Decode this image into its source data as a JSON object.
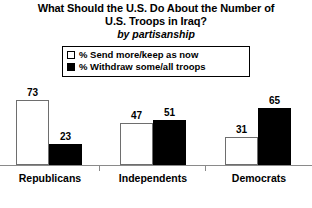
{
  "title": {
    "line1": "What Should the U.S. Do About the Number of",
    "line2": "U.S. Troops in Iraq?",
    "subtitle": "by partisanship"
  },
  "legend": {
    "items": [
      {
        "label": "% Send more/keep as now",
        "style": "open",
        "color": "#ffffff"
      },
      {
        "label": "% Withdraw some/all troops",
        "style": "solid",
        "color": "#000000"
      }
    ]
  },
  "axis": {
    "baseline_color": "#8a8a8a",
    "tick_count": 2
  },
  "chart_data": {
    "type": "bar",
    "title": "What Should the U.S. Do About the Number of U.S. Troops in Iraq?",
    "subtitle": "by partisanship",
    "xlabel": "",
    "ylabel": "",
    "ylim": [
      0,
      80
    ],
    "grid": false,
    "legend_position": "top-center",
    "categories": [
      "Republicans",
      "Independents",
      "Democrats"
    ],
    "series": [
      {
        "name": "% Send more/keep as now",
        "color": "#ffffff",
        "values": [
          73,
          47,
          31
        ]
      },
      {
        "name": "% Withdraw some/all troops",
        "color": "#000000",
        "values": [
          23,
          51,
          65
        ]
      }
    ],
    "value_labels": [
      "73",
      "23",
      "47",
      "51",
      "31",
      "65"
    ]
  },
  "bars": [
    {
      "id": "rep-send",
      "value": "73",
      "style": "open",
      "left": 16,
      "width": 33,
      "height": 65,
      "label_left": 12,
      "label_top": 87
    },
    {
      "id": "rep-withdraw",
      "value": "23",
      "style": "solid",
      "left": 49,
      "width": 33,
      "height": 21,
      "label_left": 45,
      "label_top": 131
    },
    {
      "id": "ind-send",
      "value": "47",
      "style": "open",
      "left": 120,
      "width": 33,
      "height": 42,
      "label_left": 116,
      "label_top": 110
    },
    {
      "id": "ind-withdraw",
      "value": "51",
      "style": "solid",
      "left": 153,
      "width": 33,
      "height": 45,
      "label_left": 149,
      "label_top": 107
    },
    {
      "id": "dem-send",
      "value": "31",
      "style": "open",
      "left": 225,
      "width": 33,
      "height": 28,
      "label_left": 221,
      "label_top": 124
    },
    {
      "id": "dem-withdraw",
      "value": "65",
      "style": "solid",
      "left": 258,
      "width": 33,
      "height": 57,
      "label_left": 254,
      "label_top": 95
    }
  ],
  "group_labels": [
    {
      "text": "Republicans",
      "left": 4,
      "width": 92
    },
    {
      "text": "Independents",
      "left": 106,
      "width": 94
    },
    {
      "text": "Democrats",
      "left": 214,
      "width": 90
    }
  ],
  "ticks": [
    99,
    205
  ]
}
